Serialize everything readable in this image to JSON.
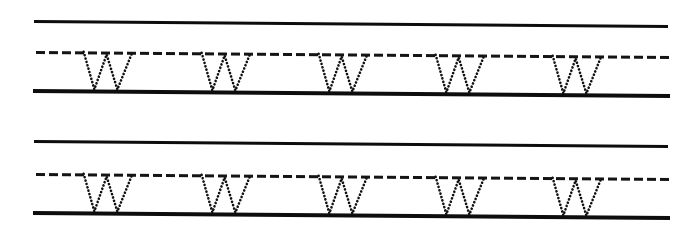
{
  "worksheet": {
    "title": "Letter W tracing practice worksheet",
    "letter": "W",
    "letter_case": "uppercase",
    "trace_style": "dotted",
    "ink_color": "#111111",
    "paper_color": "#ffffff",
    "rows_count": 2,
    "letters_per_row": 5,
    "page_skew_degrees": 0.45
  },
  "rows": [
    {
      "id": "row-1",
      "label": "Practice row 1",
      "top": 0,
      "guides": [
        {
          "id": "row1-top-line",
          "kind": "solid",
          "label": "top line",
          "x": 34,
          "y": 20,
          "width": 634,
          "angle": 0.45
        },
        {
          "id": "row1-mid-line",
          "kind": "dashed",
          "label": "dashed midline",
          "x": 36,
          "y": 51,
          "width": 636,
          "angle": 0.45
        },
        {
          "id": "row1-base-line",
          "kind": "solid",
          "label": "baseline",
          "x": 33,
          "y": 89,
          "width": 637,
          "angle": 0.45
        }
      ],
      "letters": [
        {
          "id": "row1-letter-1",
          "char": "W",
          "x": 82,
          "y": 51,
          "width": 59,
          "height": 40,
          "angle": 0.45
        },
        {
          "id": "row1-letter-2",
          "char": "W",
          "x": 200,
          "y": 52,
          "width": 59,
          "height": 40,
          "angle": 0.45
        },
        {
          "id": "row1-letter-3",
          "char": "W",
          "x": 317,
          "y": 53,
          "width": 59,
          "height": 40,
          "angle": 0.45
        },
        {
          "id": "row1-letter-4",
          "char": "W",
          "x": 434,
          "y": 54,
          "width": 59,
          "height": 40,
          "angle": 0.45
        },
        {
          "id": "row1-letter-5",
          "char": "W",
          "x": 551,
          "y": 55,
          "width": 59,
          "height": 40,
          "angle": 0.45
        }
      ]
    },
    {
      "id": "row-2",
      "label": "Practice row 2",
      "top": 120,
      "guides": [
        {
          "id": "row2-top-line",
          "kind": "solid",
          "label": "top line",
          "x": 34,
          "y": 20,
          "width": 634,
          "angle": 0.45
        },
        {
          "id": "row2-mid-line",
          "kind": "dashed",
          "label": "dashed midline",
          "x": 36,
          "y": 53,
          "width": 636,
          "angle": 0.45
        },
        {
          "id": "row2-base-line",
          "kind": "solid",
          "label": "baseline",
          "x": 33,
          "y": 91,
          "width": 637,
          "angle": 0.45
        }
      ],
      "letters": [
        {
          "id": "row2-letter-1",
          "char": "W",
          "x": 82,
          "y": 53,
          "width": 59,
          "height": 40,
          "angle": 0.45
        },
        {
          "id": "row2-letter-2",
          "char": "W",
          "x": 200,
          "y": 54,
          "width": 59,
          "height": 40,
          "angle": 0.45
        },
        {
          "id": "row2-letter-3",
          "char": "W",
          "x": 317,
          "y": 55,
          "width": 59,
          "height": 40,
          "angle": 0.45
        },
        {
          "id": "row2-letter-4",
          "char": "W",
          "x": 434,
          "y": 56,
          "width": 59,
          "height": 40,
          "angle": 0.45
        },
        {
          "id": "row2-letter-5",
          "char": "W",
          "x": 551,
          "y": 57,
          "width": 59,
          "height": 40,
          "angle": 0.45
        }
      ]
    }
  ]
}
